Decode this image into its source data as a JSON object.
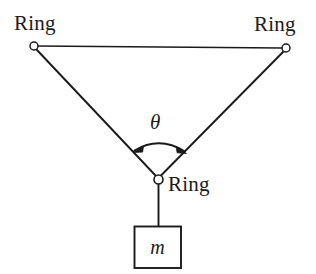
{
  "figure": {
    "background_color": "#ffffff",
    "stroke_color": "#1a1a1a",
    "labels": {
      "ring_top_left": "Ring",
      "ring_top_right": "Ring",
      "ring_bottom": "Ring",
      "angle_symbol": "θ",
      "mass_symbol": "m"
    },
    "geometry": {
      "ring_top_left": {
        "cx": 34,
        "cy": 46,
        "r": 4
      },
      "ring_top_right": {
        "cx": 286,
        "cy": 48,
        "r": 4
      },
      "ring_bottom": {
        "cx": 158,
        "cy": 179,
        "r": 4.5
      },
      "top_cord": {
        "x1": 37,
        "y1": 46,
        "x2": 282,
        "y2": 48
      },
      "left_cord": {
        "x1": 36,
        "y1": 50,
        "x2": 155,
        "y2": 176
      },
      "right_cord": {
        "x1": 284,
        "y1": 52,
        "x2": 161,
        "y2": 176
      },
      "hanging_string": {
        "x1": 158,
        "y1": 184,
        "x2": 158,
        "y2": 226
      },
      "mass_box": {
        "x": 134,
        "y": 226,
        "width": 47,
        "height": 42
      },
      "angle_arc": {
        "start_x": 133,
        "start_y": 152,
        "end_x": 186,
        "end_y": 153,
        "apex_x": 159,
        "apex_y": 137,
        "arrowheads": "both-ends"
      }
    }
  }
}
